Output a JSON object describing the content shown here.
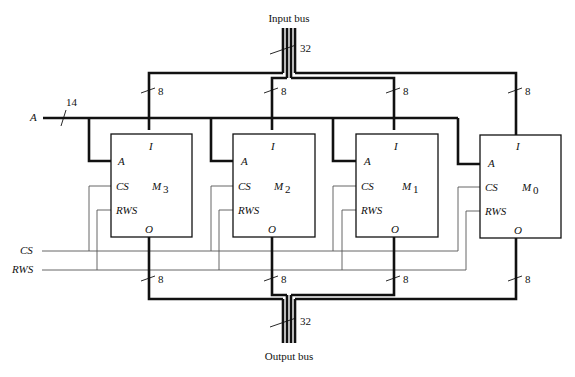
{
  "diagram": {
    "input_bus_label": "Input bus",
    "output_bus_label": "Output bus",
    "bus_width_32": "32",
    "branch_width_8": "8",
    "address_line_label": "A",
    "address_width": "14",
    "cs_line_label": "CS",
    "rws_line_label": "RWS",
    "modules": [
      {
        "name": "M",
        "sub": "3",
        "pin_i": "I",
        "pin_a": "A",
        "pin_cs": "CS",
        "pin_rws": "RWS",
        "pin_o": "O"
      },
      {
        "name": "M",
        "sub": "2",
        "pin_i": "I",
        "pin_a": "A",
        "pin_cs": "CS",
        "pin_rws": "RWS",
        "pin_o": "O"
      },
      {
        "name": "M",
        "sub": "1",
        "pin_i": "I",
        "pin_a": "A",
        "pin_cs": "CS",
        "pin_rws": "RWS",
        "pin_o": "O"
      },
      {
        "name": "M",
        "sub": "0",
        "pin_i": "I",
        "pin_a": "A",
        "pin_cs": "CS",
        "pin_rws": "RWS",
        "pin_o": "O"
      }
    ]
  }
}
